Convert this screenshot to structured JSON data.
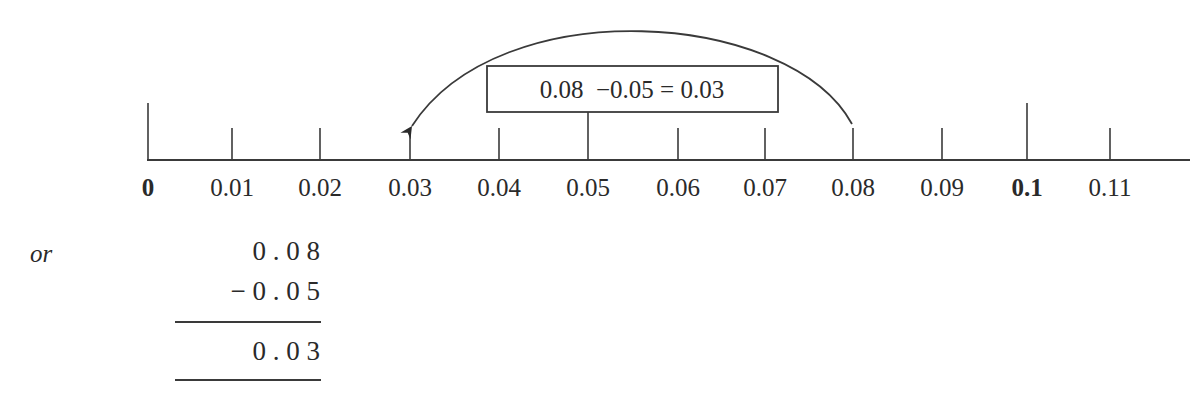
{
  "number_line": {
    "ticks": [
      {
        "value": 0,
        "label": "0",
        "bold": true,
        "x": 148,
        "tall": true
      },
      {
        "value": 0.01,
        "label": "0.01",
        "bold": false,
        "x": 232,
        "tall": false
      },
      {
        "value": 0.02,
        "label": "0.02",
        "bold": false,
        "x": 320,
        "tall": false
      },
      {
        "value": 0.03,
        "label": "0.03",
        "bold": false,
        "x": 410,
        "tall": false
      },
      {
        "value": 0.04,
        "label": "0.04",
        "bold": false,
        "x": 499,
        "tall": false
      },
      {
        "value": 0.05,
        "label": "0.05",
        "bold": false,
        "x": 588,
        "tall": false
      },
      {
        "value": 0.06,
        "label": "0.06",
        "bold": false,
        "x": 678,
        "tall": false
      },
      {
        "value": 0.07,
        "label": "0.07",
        "bold": false,
        "x": 765,
        "tall": false
      },
      {
        "value": 0.08,
        "label": "0.08",
        "bold": false,
        "x": 853,
        "tall": false
      },
      {
        "value": 0.09,
        "label": "0.09",
        "bold": false,
        "x": 942,
        "tall": false
      },
      {
        "value": 0.1,
        "label": "0.1",
        "bold": true,
        "x": 1027,
        "tall": true
      },
      {
        "value": 0.11,
        "label": "0.11",
        "bold": false,
        "x": 1110,
        "tall": false
      }
    ],
    "jump": {
      "from": 0.08,
      "to": 0.03,
      "direction": "left"
    },
    "equation_box": {
      "text": "0.08  −0.05 = 0.03"
    }
  },
  "alternative": {
    "connector": "or",
    "column_subtraction": {
      "minuend": "0 . 0 8",
      "subtrahend": "− 0 . 0 5",
      "result": "0 . 0 3"
    }
  },
  "colors": {
    "ink": "#2a2a2a",
    "background": "#ffffff"
  }
}
